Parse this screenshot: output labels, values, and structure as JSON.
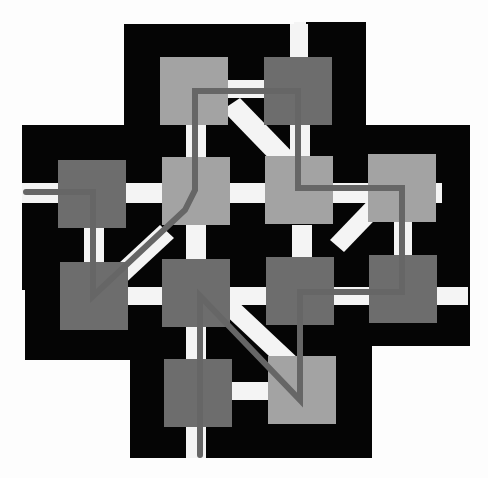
{
  "colors": {
    "background": "#fdfdfd",
    "body": "#050505",
    "channel": "#f4f4f4",
    "square_light": "#a3a3a3",
    "square_dark": "#6d6d6d",
    "path": "#666666"
  },
  "squares": [
    {
      "id": "r0c1",
      "x": 160,
      "y": 57,
      "tone": "light"
    },
    {
      "id": "r0c2",
      "x": 264,
      "y": 57,
      "tone": "dark"
    },
    {
      "id": "r1c0",
      "x": 58,
      "y": 160,
      "tone": "dark"
    },
    {
      "id": "r1c1",
      "x": 162,
      "y": 157,
      "tone": "light"
    },
    {
      "id": "r1c2",
      "x": 265,
      "y": 156,
      "tone": "light"
    },
    {
      "id": "r1c3",
      "x": 368,
      "y": 154,
      "tone": "light"
    },
    {
      "id": "r2c0",
      "x": 60,
      "y": 262,
      "tone": "dark"
    },
    {
      "id": "r2c1",
      "x": 162,
      "y": 259,
      "tone": "dark"
    },
    {
      "id": "r2c2",
      "x": 266,
      "y": 257,
      "tone": "dark"
    },
    {
      "id": "r2c3",
      "x": 369,
      "y": 255,
      "tone": "dark"
    },
    {
      "id": "r3c1",
      "x": 164,
      "y": 359,
      "tone": "dark"
    },
    {
      "id": "r3c2",
      "x": 268,
      "y": 356,
      "tone": "light"
    }
  ],
  "square_size": 68
}
